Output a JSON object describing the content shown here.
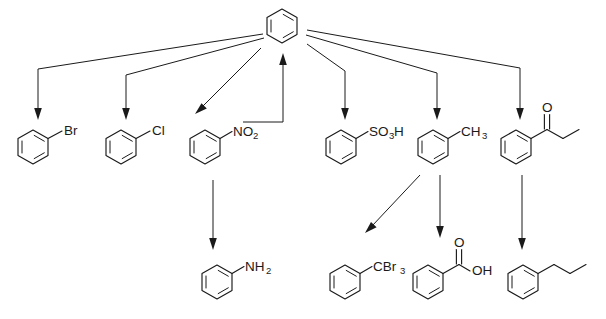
{
  "diagram": {
    "type": "chemical-reaction-scheme",
    "stroke_color": "#1a1a1a",
    "background_color": "#ffffff"
  },
  "labels": {
    "br": "Br",
    "cl": "Cl",
    "no2_main": "NO",
    "no2_sub": "2",
    "so3h_s": "SO",
    "so3h_sub": "3",
    "so3h_h": "H",
    "ch3_main": "CH",
    "ch3_sub": "3",
    "nh2_main": "NH",
    "nh2_sub": "2",
    "cbr3_main": "CBr",
    "cbr3_sub": "3",
    "oxygen": "O",
    "hydroxyl": "OH"
  },
  "structures": [
    {
      "id": "benzene",
      "name": "benzene",
      "substituent": "",
      "row": "top-center"
    },
    {
      "id": "bromobenzene",
      "name": "bromobenzene",
      "substituent": "Br",
      "row": "middle"
    },
    {
      "id": "chlorobenzene",
      "name": "chlorobenzene",
      "substituent": "Cl",
      "row": "middle"
    },
    {
      "id": "nitrobenzene",
      "name": "nitrobenzene",
      "substituent": "NO2",
      "row": "middle"
    },
    {
      "id": "benzenesulfonic-acid",
      "name": "benzenesulfonic acid",
      "substituent": "SO3H",
      "row": "middle"
    },
    {
      "id": "toluene",
      "name": "toluene",
      "substituent": "CH3",
      "row": "middle"
    },
    {
      "id": "propiophenone",
      "name": "propiophenone",
      "substituent": "C(=O)CH2CH3",
      "row": "middle"
    },
    {
      "id": "aniline",
      "name": "aniline",
      "substituent": "NH2",
      "row": "bottom"
    },
    {
      "id": "benzotribromide",
      "name": "benzotribromide",
      "substituent": "CBr3",
      "row": "bottom"
    },
    {
      "id": "benzoic-acid",
      "name": "benzoic acid",
      "substituent": "COOH",
      "row": "bottom"
    },
    {
      "id": "propylbenzene",
      "name": "propylbenzene",
      "substituent": "CH2CH2CH3",
      "row": "bottom"
    }
  ],
  "reactions": [
    {
      "from": "benzene",
      "to": "bromobenzene"
    },
    {
      "from": "benzene",
      "to": "chlorobenzene"
    },
    {
      "from": "benzene",
      "to": "nitrobenzene"
    },
    {
      "from": "benzene",
      "to": "benzenesulfonic-acid"
    },
    {
      "from": "benzene",
      "to": "toluene"
    },
    {
      "from": "benzene",
      "to": "propiophenone"
    },
    {
      "from": "nitrobenzene",
      "to": "aniline"
    },
    {
      "from": "aniline",
      "to": "benzene"
    },
    {
      "from": "toluene",
      "to": "benzotribromide"
    },
    {
      "from": "toluene",
      "to": "benzoic-acid"
    },
    {
      "from": "propiophenone",
      "to": "propylbenzene"
    }
  ]
}
